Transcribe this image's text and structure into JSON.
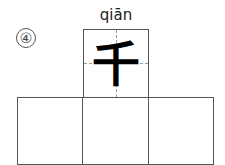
{
  "exercise": {
    "number": "④",
    "pinyin": "qiān",
    "character": "千",
    "practice_boxes": 3
  }
}
